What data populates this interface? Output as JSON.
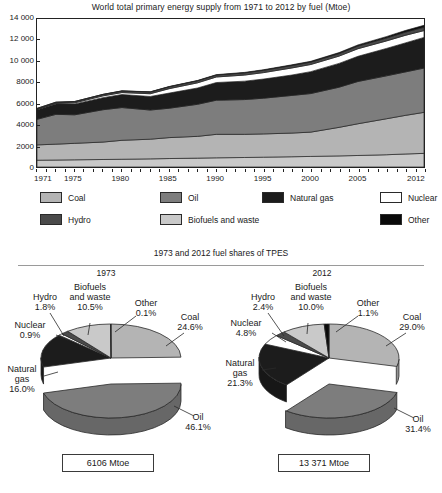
{
  "colors": {
    "coal": "#b4b4b4",
    "oil": "#7d7d7d",
    "natural_gas": "#1c1c1c",
    "nuclear": "#ffffff",
    "hydro": "#4a4a4a",
    "biofuels": "#c9c9c9",
    "other": "#0a0a0a",
    "outline": "#2a2a2a",
    "text": "#1a1a1a"
  },
  "area_section": {
    "title": "World total primary energy supply from 1971 to 2012 by fuel (Mtoe)"
  },
  "legend": {
    "items": [
      {
        "label": "Coal",
        "swatch": "coal"
      },
      {
        "label": "Oil",
        "swatch": "oil"
      },
      {
        "label": "Natural gas",
        "swatch": "natural_gas"
      },
      {
        "label": "Nuclear",
        "swatch": "nuclear"
      },
      {
        "label": "Hydro",
        "swatch": "hydro"
      },
      {
        "label": "Biofuels and waste",
        "swatch": "biofuels"
      },
      {
        "label": "Other",
        "swatch": "other"
      }
    ]
  },
  "pie_section": {
    "subtitle": "1973 and 2012 fuel shares of TPES",
    "left_year": "1973",
    "right_year": "2012",
    "left_total": "6106 Mtoe",
    "right_total": "13 371 Mtoe"
  },
  "chart_data": [
    {
      "type": "area",
      "title": "World total primary energy supply from 1971 to 2012 by fuel (Mtoe)",
      "xlabel": "",
      "ylabel": "Mtoe",
      "ylim": [
        0,
        14000
      ],
      "yticks": [
        "0",
        "2000",
        "4000",
        "6000",
        "8000",
        "10 000",
        "12 000",
        "14 000"
      ],
      "ytick_values": [
        0,
        2000,
        4000,
        6000,
        8000,
        10000,
        12000,
        14000
      ],
      "xlim": [
        1971,
        2012
      ],
      "xticks": [
        "1971",
        "1975",
        "1980",
        "1985",
        "1990",
        "1995",
        "2000",
        "2005",
        "2012"
      ],
      "xtick_values": [
        1971,
        1975,
        1980,
        1985,
        1990,
        1995,
        2000,
        2005,
        2012
      ],
      "grid": false,
      "stacked": true,
      "stack_order_bottom_to_top": [
        "Biofuels and waste",
        "Coal",
        "Oil",
        "Natural gas",
        "Nuclear",
        "Hydro",
        "Other"
      ],
      "x": [
        1971,
        1973,
        1975,
        1978,
        1980,
        1983,
        1985,
        1988,
        1990,
        1993,
        1995,
        1998,
        2000,
        2003,
        2005,
        2008,
        2010,
        2012
      ],
      "series": [
        {
          "name": "Biofuels and waste",
          "color": "biofuels",
          "values": [
            642,
            660,
            680,
            710,
            735,
            770,
            800,
            840,
            870,
            900,
            930,
            970,
            1000,
            1050,
            1090,
            1160,
            1230,
            1290
          ]
        },
        {
          "name": "Coal",
          "color": "coal",
          "values": [
            1450,
            1500,
            1560,
            1650,
            1790,
            1860,
            1980,
            2060,
            2220,
            2190,
            2200,
            2240,
            2300,
            2700,
            3000,
            3400,
            3650,
            3880
          ]
        },
        {
          "name": "Oil",
          "color": "oil",
          "values": [
            2420,
            2820,
            2700,
            3060,
            3100,
            2760,
            2780,
            3030,
            3230,
            3290,
            3380,
            3560,
            3650,
            3800,
            4000,
            4060,
            4110,
            4190
          ]
        },
        {
          "name": "Natural gas",
          "color": "natural_gas",
          "values": [
            890,
            980,
            1030,
            1140,
            1230,
            1280,
            1430,
            1540,
            1670,
            1740,
            1810,
            1930,
            2070,
            2250,
            2380,
            2590,
            2740,
            2900
          ]
        },
        {
          "name": "Nuclear",
          "color": "nuclear",
          "values": [
            29,
            53,
            100,
            170,
            186,
            260,
            420,
            490,
            526,
            580,
            610,
            670,
            676,
            690,
            720,
            710,
            720,
            642
          ]
        },
        {
          "name": "Hydro",
          "color": "hydro",
          "values": [
            104,
            110,
            120,
            135,
            148,
            165,
            180,
            195,
            184,
            205,
            220,
            230,
            225,
            240,
            251,
            280,
            300,
            322
          ]
        },
        {
          "name": "Other",
          "color": "other",
          "values": [
            4,
            6,
            9,
            12,
            14,
            18,
            22,
            28,
            36,
            44,
            52,
            66,
            78,
            92,
            108,
            130,
            155,
            180
          ]
        }
      ]
    },
    {
      "type": "pie",
      "title": "1973",
      "total_label": "6106 Mtoe",
      "labels": [
        "Coal",
        "Oil",
        "Natural gas",
        "Nuclear",
        "Hydro",
        "Biofuels and waste",
        "Other"
      ],
      "values": [
        24.6,
        46.1,
        16.0,
        0.9,
        1.8,
        10.5,
        0.1
      ],
      "value_labels": [
        "24.6%",
        "46.1%",
        "16.0%",
        "0.9%",
        "1.8%",
        "10.5%",
        "0.1%"
      ],
      "exploded": [
        "Oil"
      ]
    },
    {
      "type": "pie",
      "title": "2012",
      "total_label": "13 371 Mtoe",
      "labels": [
        "Coal",
        "Oil",
        "Natural gas",
        "Nuclear",
        "Hydro",
        "Biofuels and waste",
        "Other"
      ],
      "values": [
        29.0,
        31.4,
        21.3,
        4.8,
        2.4,
        10.0,
        1.1
      ],
      "value_labels": [
        "29.0%",
        "31.4%",
        "21.3%",
        "4.8%",
        "2.4%",
        "10.0%",
        "1.1%"
      ],
      "exploded": [
        "Oil"
      ]
    }
  ]
}
